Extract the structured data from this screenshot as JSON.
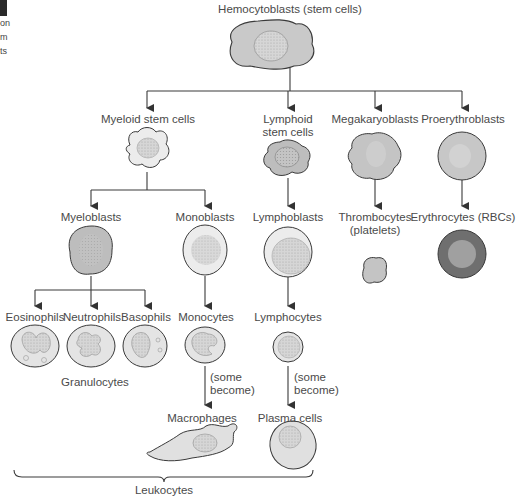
{
  "figure": {
    "margin_fragment": {
      "lines": [
        "on",
        "m",
        "ts"
      ]
    },
    "root": {
      "label": "Hemocytoblasts (stem cells)"
    },
    "level1": [
      {
        "id": "myeloid",
        "label": "Myeloid stem cells"
      },
      {
        "id": "lymphoid",
        "label_lines": [
          "Lymphoid",
          "stem cells"
        ]
      },
      {
        "id": "megakaryoblasts",
        "label": "Megakaryoblasts"
      },
      {
        "id": "proerythroblasts",
        "label": "Proerythroblasts"
      }
    ],
    "level2": [
      {
        "id": "myeloblasts",
        "label": "Myeloblasts"
      },
      {
        "id": "monoblasts",
        "label": "Monoblasts"
      },
      {
        "id": "lymphoblasts",
        "label": "Lymphoblasts"
      },
      {
        "id": "thrombocytes",
        "label_lines": [
          "Thrombocytes",
          "(platelets)"
        ]
      },
      {
        "id": "erythrocytes",
        "label": "Erythrocytes (RBCs)"
      }
    ],
    "level3": [
      {
        "id": "eosinophils",
        "label": "Eosinophils"
      },
      {
        "id": "neutrophils",
        "label": "Neutrophils"
      },
      {
        "id": "basophils",
        "label": "Basophils"
      },
      {
        "id": "monocytes",
        "label": "Monocytes"
      },
      {
        "id": "lymphocytes",
        "label": "Lymphocytes"
      }
    ],
    "group_label_granulocytes": "Granulocytes",
    "transition_note_lines": [
      "(some",
      "become)"
    ],
    "level4": [
      {
        "id": "macrophages",
        "label": "Macrophages"
      },
      {
        "id": "plasma_cells",
        "label": "Plasma cells"
      }
    ],
    "bracket_label": "Leukocytes",
    "colors": {
      "line": "#3a3a3a",
      "cell_light": "#e6e6e6",
      "cell_medium": "#c9c9c9",
      "cell_dark": "#b5b5b5",
      "nucleus": "#d3d3d3",
      "rbc_rim": "#6e6e6e",
      "rbc_center": "#9c9c9c"
    }
  }
}
